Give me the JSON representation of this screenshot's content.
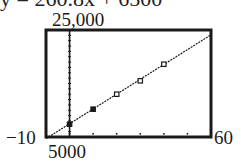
{
  "partial_top_text": "y = 260.8x + 6500",
  "chart_data": {
    "type": "scatter",
    "title": "",
    "xlabel": "",
    "ylabel": "",
    "xlim": [
      -10,
      60
    ],
    "ylim": [
      5000,
      25000
    ],
    "x_tick_step": 10,
    "y_tick_step": 1000,
    "grid": false,
    "window_labels": {
      "xmin": "−10",
      "xmax": "60",
      "ymin": "5000",
      "ymax": "25,000"
    },
    "series": [
      {
        "name": "data",
        "marker": "square",
        "x": [
          0,
          10,
          20,
          30,
          40
        ],
        "y": [
          7400,
          10200,
          13000,
          15500,
          18600
        ]
      },
      {
        "name": "regression line",
        "style": "dotted-line",
        "x": [
          -10,
          60
        ],
        "y": [
          4700,
          24100
        ]
      }
    ]
  }
}
